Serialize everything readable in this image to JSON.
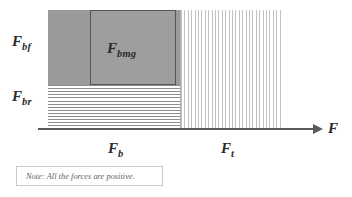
{
  "diagram": {
    "axis": {
      "name": "force-axis",
      "label": "F",
      "direction": "right",
      "arrow": true
    },
    "regions": [
      {
        "key": "fbf",
        "label_base": "F",
        "label_sub": "bf",
        "fill": "solid-grey",
        "color": "#9a9a9a",
        "position": "upper-left"
      },
      {
        "key": "fbmg",
        "label_base": "F",
        "label_sub": "bmg",
        "fill": "solid-grey-outlined",
        "color": "#9e9e9e",
        "border_color": "#555555",
        "position": "upper-middle"
      },
      {
        "key": "fbr",
        "label_base": "F",
        "label_sub": "br",
        "fill": "horizontal-hatch",
        "color": "#8d8d8d",
        "position": "lower-left"
      },
      {
        "key": "ft",
        "label_base": "F",
        "label_sub": "t",
        "fill": "vertical-hatch",
        "color": "#c2c2c2",
        "position": "right"
      }
    ],
    "axis_segments": [
      {
        "key": "fb",
        "label_base": "F",
        "label_sub": "b"
      },
      {
        "key": "ft",
        "label_base": "F",
        "label_sub": "t"
      }
    ]
  },
  "note": {
    "text": "Note: All the forces are positive."
  },
  "chart_data": {
    "type": "bar",
    "orientation": "horizontal-stacked",
    "title": "",
    "xlabel": "F",
    "ylabel": "",
    "categories": [
      "F_b",
      "F_t"
    ],
    "series": [
      {
        "name": "F_bf",
        "values": [
          133,
          0
        ]
      },
      {
        "name": "F_bmg",
        "values": [
          86,
          0
        ]
      },
      {
        "name": "F_br",
        "values": [
          133,
          0
        ]
      },
      {
        "name": "F_t",
        "values": [
          0,
          100
        ]
      }
    ],
    "annotations": [
      "Note: All the forces are positive."
    ],
    "grid": false,
    "legend": "none"
  }
}
